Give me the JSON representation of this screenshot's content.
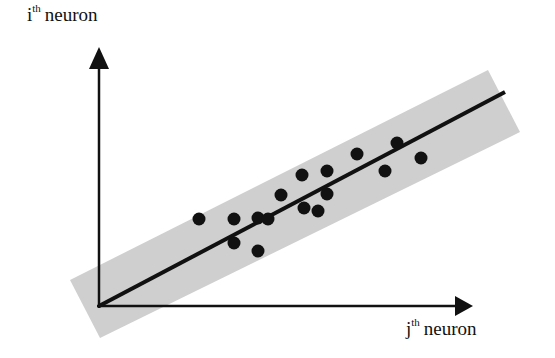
{
  "diagram": {
    "y_axis_label": {
      "base": "i",
      "sup": "th",
      "text": "neuron"
    },
    "x_axis_label": {
      "base": "j",
      "sup": "th",
      "text": "neuron"
    },
    "colors": {
      "band": "#cfcfcf",
      "axis": "#111111",
      "line": "#111111",
      "dot": "#111111",
      "background": "#ffffff"
    },
    "band": {
      "points": "70,280 100,338 520,132 488,70"
    },
    "axes": {
      "origin": [
        99,
        306
      ],
      "y_end": [
        99,
        70
      ],
      "x_end": [
        470,
        306
      ]
    },
    "fit_line": {
      "x1": 99,
      "y1": 306,
      "x2": 505,
      "y2": 92
    },
    "points": [
      {
        "x": 199,
        "y": 219
      },
      {
        "x": 234,
        "y": 219
      },
      {
        "x": 258,
        "y": 218
      },
      {
        "x": 268,
        "y": 219
      },
      {
        "x": 234,
        "y": 243
      },
      {
        "x": 258,
        "y": 251
      },
      {
        "x": 281,
        "y": 195
      },
      {
        "x": 302,
        "y": 175
      },
      {
        "x": 304,
        "y": 208
      },
      {
        "x": 318,
        "y": 211
      },
      {
        "x": 327,
        "y": 171
      },
      {
        "x": 327,
        "y": 194
      },
      {
        "x": 357,
        "y": 154
      },
      {
        "x": 385,
        "y": 171
      },
      {
        "x": 397,
        "y": 143
      },
      {
        "x": 421,
        "y": 158
      }
    ]
  }
}
